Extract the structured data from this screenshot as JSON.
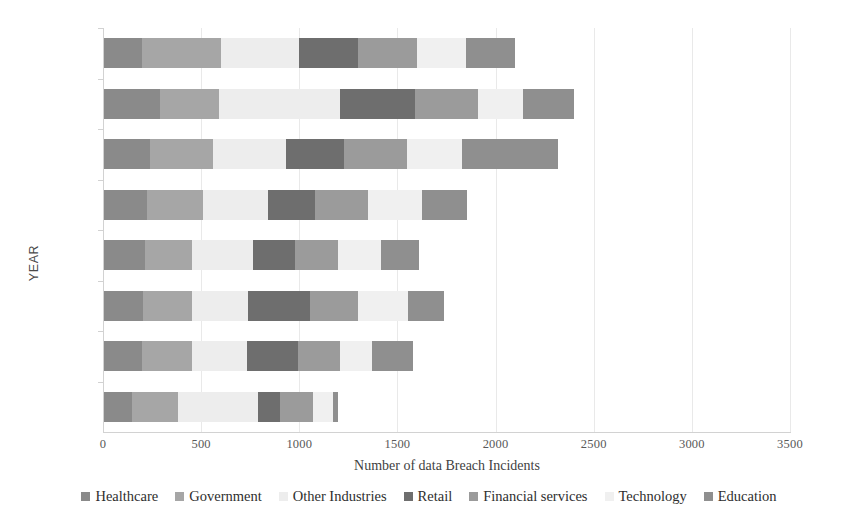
{
  "chart_data": {
    "type": "bar",
    "orientation": "horizontal",
    "stacked": true,
    "title": "",
    "xlabel": "Number of data Breach Incidents",
    "ylabel": "YEAR",
    "xlim": [
      0,
      3500
    ],
    "xticks": [
      "0",
      "500",
      "1000",
      "1500",
      "2000",
      "2500",
      "3000",
      "3500"
    ],
    "xtick_values": [
      0,
      500,
      1000,
      1500,
      2000,
      2500,
      3000,
      3500
    ],
    "grid": true,
    "legend_position": "bottom",
    "categories": [
      "2020",
      "2019",
      "2018",
      "2017",
      "2016",
      "2015",
      "2014",
      "2013"
    ],
    "series": [
      {
        "name": "Healthcare",
        "color": "#8a8a8a",
        "values": [
          200,
          290,
          240,
          225,
          215,
          205,
          200,
          150
        ]
      },
      {
        "name": "Government",
        "color": "#a6a6a6",
        "values": [
          400,
          300,
          320,
          285,
          240,
          250,
          255,
          230
        ]
      },
      {
        "name": "Other Industries",
        "color": "#ededed",
        "values": [
          400,
          620,
          370,
          330,
          310,
          285,
          280,
          410
        ]
      },
      {
        "name": "Retail",
        "color": "#6e6e6e",
        "values": [
          300,
          380,
          300,
          240,
          215,
          315,
          260,
          110
        ]
      },
      {
        "name": "Financial services",
        "color": "#9b9b9b",
        "values": [
          300,
          320,
          320,
          270,
          220,
          245,
          215,
          170
        ]
      },
      {
        "name": "Technology",
        "color": "#f0f0f0",
        "values": [
          250,
          230,
          280,
          275,
          215,
          255,
          160,
          100
        ]
      },
      {
        "name": "Education",
        "color": "#8f8f8f",
        "values": [
          250,
          260,
          490,
          230,
          195,
          180,
          210,
          30
        ]
      }
    ],
    "totals": [
      2100,
      2400,
      2320,
      1855,
      1610,
      1735,
      1580,
      1200
    ],
    "bar_end_values": [
      3080,
      2550,
      2340,
      1990,
      1750,
      1860,
      1720,
      1200
    ]
  },
  "axis": {
    "x_title": "Number of data Breach Incidents",
    "y_title": "YEAR"
  }
}
